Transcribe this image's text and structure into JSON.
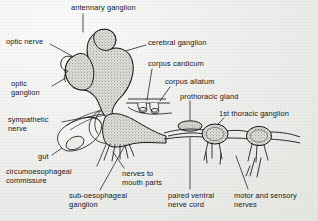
{
  "figure": {
    "media": "printed line drawing on light grey paper",
    "background_color": "#f0f0ee",
    "ink_color": "#16161a",
    "stipple_fill_color": "#d9d9d4",
    "diagram_type": "labelled anatomical line drawing"
  },
  "labels": [
    {
      "id": "antennary-ganglion",
      "text": "antennary ganglion",
      "x": 71,
      "y": 4,
      "align": "left",
      "width": 78
    },
    {
      "id": "optic-nerve",
      "text": "optic nerve",
      "x": 6,
      "y": 38,
      "align": "left",
      "width": 50
    },
    {
      "id": "cerebral-ganglion",
      "text": "cerebral ganglion",
      "x": 148,
      "y": 39,
      "align": "left",
      "width": 72
    },
    {
      "id": "corpus-cardicum",
      "text": "corpus cardicum",
      "x": 148,
      "y": 60,
      "align": "left",
      "width": 68
    },
    {
      "id": "corpus-allatum",
      "text": "corpus allatum",
      "x": 165,
      "y": 78,
      "align": "left",
      "width": 62
    },
    {
      "id": "optic-ganglion",
      "text": "optic\nganglion",
      "x": 11,
      "y": 80,
      "align": "left",
      "width": 44
    },
    {
      "id": "prothoracic-gland",
      "text": "prothoracic gland",
      "x": 180,
      "y": 93,
      "align": "left",
      "width": 72
    },
    {
      "id": "first-thoracic-ganglion",
      "text": "1st thoracic ganglion",
      "x": 219,
      "y": 110,
      "align": "left",
      "width": 84
    },
    {
      "id": "sympathetic-nerve",
      "text": "sympathetic\nnerve",
      "x": 8,
      "y": 116,
      "align": "left",
      "width": 56
    },
    {
      "id": "gut",
      "text": "gut",
      "x": 38,
      "y": 153,
      "align": "left",
      "width": 18
    },
    {
      "id": "circumoesophageal-commissure",
      "text": "circumoesophageal\ncommissure",
      "x": 6,
      "y": 168,
      "align": "left",
      "width": 96
    },
    {
      "id": "nerves-to-mouth-parts",
      "text": "nerves to\nmouth parts",
      "x": 122,
      "y": 170,
      "align": "left",
      "width": 56
    },
    {
      "id": "sub-oesophageal-ganglion",
      "text": "sub-oesophageal\nganglion",
      "x": 69,
      "y": 192,
      "align": "left",
      "width": 78
    },
    {
      "id": "paired-ventral-nerve-cord",
      "text": "paired ventral\nnerve cord",
      "x": 168,
      "y": 192,
      "align": "left",
      "width": 62
    },
    {
      "id": "motor-and-sensory-nerves",
      "text": "motor and sensory\nnerves",
      "x": 234,
      "y": 192,
      "align": "left",
      "width": 80
    }
  ],
  "structures": [
    {
      "id": "antennary-ganglion-lobe",
      "kind": "stippled-lobe",
      "note": "small round lobe at top of brain"
    },
    {
      "id": "cerebral-ganglion-body",
      "kind": "stippled-lobe",
      "note": "large pear-shaped brain mass"
    },
    {
      "id": "optic-ganglion-lobe",
      "kind": "stippled-lobe",
      "note": "left lateral lobe"
    },
    {
      "id": "optic-nerve-stalk",
      "kind": "outline",
      "note": "short stalk to left of optic ganglion"
    },
    {
      "id": "corpus-cardicum-body",
      "kind": "outline-pair",
      "note": "small paired sacs below brain"
    },
    {
      "id": "corpus-allatum-body",
      "kind": "outline-pair",
      "note": "small rounded bodies beside corpus cardicum"
    },
    {
      "id": "prothoracic-gland-body",
      "kind": "stippled-oval",
      "note": "isolated stippled ellipse"
    },
    {
      "id": "sub-oesophageal-ganglion-body",
      "kind": "stippled-mass",
      "note": "elongate mass under the brain"
    },
    {
      "id": "first-thoracic-ganglion-body",
      "kind": "stippled-node",
      "note": "first node on the nerve cord"
    },
    {
      "id": "second-thoracic-ganglion-body",
      "kind": "stippled-node",
      "note": "second node on the nerve cord"
    },
    {
      "id": "ventral-nerve-cord-connectives",
      "kind": "double-line",
      "note": "paired connectives linking ganglia"
    },
    {
      "id": "gut-tube",
      "kind": "outline-tube",
      "note": "cut cylindrical gut with elliptical lumen"
    },
    {
      "id": "sympathetic-nerve-line",
      "kind": "thin-line",
      "note": "fine nerve over the gut"
    },
    {
      "id": "circumoesophageal-commissure-loop",
      "kind": "outline-loop",
      "note": "loop encircling the oesophagus"
    },
    {
      "id": "mouth-part-nerves",
      "kind": "nerve-fan",
      "note": "fan of nerves from sub-oesophageal ganglion"
    },
    {
      "id": "motor-sensory-nerve-pair",
      "kind": "nerve-fan",
      "note": "paired nerves leaving thoracic ganglia"
    }
  ]
}
